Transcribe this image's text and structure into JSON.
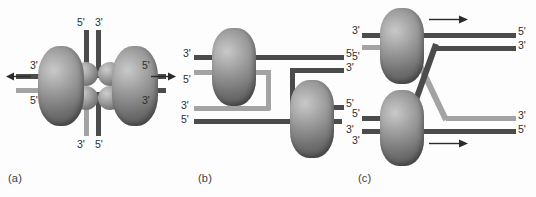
{
  "figure": {
    "caption_a": "(a)",
    "caption_b": "(b)",
    "caption_c": "(c)",
    "colors": {
      "leading_strand": "#4b4b4b",
      "lagging_strand": "#a3a3a3",
      "protein": "#8a8a8a",
      "background": "#fdfdfd",
      "text": "#2f2f2f"
    }
  },
  "panel_a": {
    "label": "(a)",
    "description": "Dimeric replication complex with two polymerase lobes and four central spheres; template strands enter top and bottom, daughter strands exit left and right",
    "labels": {
      "top_left": "5'",
      "top_right": "3'",
      "bottom_left": "3'",
      "bottom_right": "5'",
      "left_upper": "3'",
      "left_lower": "5'",
      "right_upper": "5'",
      "right_lower": "3'"
    },
    "arrows": {
      "left": "arrow-left",
      "right": "arrow-right"
    }
  },
  "panel_b": {
    "label": "(b)",
    "description": "Two separated polymerase complexes with the lagging strand looped back, trombone model",
    "labels": {
      "upper_left_top": "3'",
      "upper_left_bottom": "5'",
      "upper_right_top": "5'",
      "upper_right_bottom": "3'",
      "lower_left_top": "3'",
      "lower_left_bottom": "5'",
      "lower_right_top": "5'",
      "lower_right_bottom": "3'"
    }
  },
  "panel_c": {
    "label": "(c)",
    "description": "Two polymerase complexes moving in the same direction with strands crossing between the forks",
    "labels": {
      "upper_left_top": "3'",
      "upper_left_bottom": "5'",
      "upper_right_top": "5'",
      "upper_right_bottom": "3'",
      "lower_left_top": "5'",
      "lower_left_bottom": "3'",
      "lower_right_top": "3'",
      "lower_right_bottom": "5'"
    },
    "arrows": {
      "upper": "arrow-right",
      "lower": "arrow-right"
    }
  }
}
